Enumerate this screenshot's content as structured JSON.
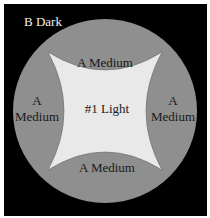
{
  "diagram": {
    "corner_label": "B Dark",
    "center_label": "#1 Light",
    "regions": [
      {
        "position": "top",
        "label_lines": [
          "A Medium"
        ]
      },
      {
        "position": "left",
        "label_lines": [
          "A",
          "Medium"
        ]
      },
      {
        "position": "right",
        "label_lines": [
          "A",
          "Medium"
        ]
      },
      {
        "position": "bottom",
        "label_lines": [
          "A Medium"
        ]
      }
    ],
    "colors": {
      "background": "#000000",
      "medium": "#8f8f8f",
      "light": "#e9e9e9",
      "text_dark": "#1a1a1a",
      "text_light": "#f0f0f0"
    }
  }
}
